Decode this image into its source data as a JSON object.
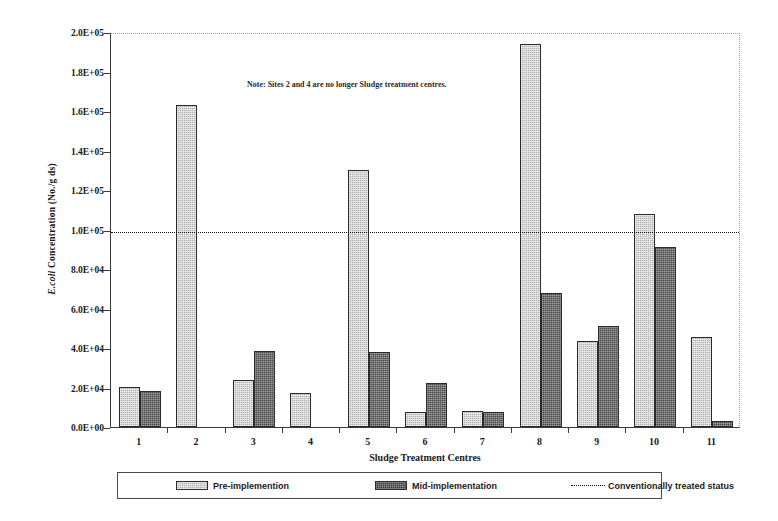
{
  "chart_data": {
    "type": "bar",
    "title": "",
    "xlabel": "Sludge Treatment Centres",
    "ylabel": "E.coli Concentration (No./g ds)",
    "ylabel_italic_part": "E.coli",
    "ylabel_rest": " Concentration (No./g ds)",
    "categories": [
      "1",
      "2",
      "3",
      "4",
      "5",
      "6",
      "7",
      "8",
      "9",
      "10",
      "11"
    ],
    "series": [
      {
        "name": "Pre-implemention",
        "color": "#b3b3b3",
        "values": [
          20500,
          163000,
          24000,
          17000,
          130000,
          7500,
          8000,
          194000,
          43500,
          108000,
          45500
        ]
      },
      {
        "name": "Mid-implementation",
        "color": "#4a4a4a",
        "values": [
          18000,
          0,
          38500,
          0,
          38000,
          22500,
          7500,
          68000,
          51000,
          91000,
          3000
        ]
      }
    ],
    "threshold": {
      "label": "Conventionally treated status",
      "value": 100000,
      "style": "dotted",
      "color": "#111111"
    },
    "ylim": [
      0,
      200000
    ],
    "ytick_values": [
      0,
      20000,
      40000,
      60000,
      80000,
      100000,
      120000,
      140000,
      160000,
      180000,
      200000
    ],
    "ytick_labels": [
      "0.0E+00",
      "2.0E+04",
      "4.0E+04",
      "6.0E+04",
      "8.0E+04",
      "1.0E+05",
      "1.2E+05",
      "1.4E+05",
      "1.6E+05",
      "1.8E+05",
      "2.0E+05"
    ],
    "grid": false,
    "legend_position": "bottom",
    "annotations": [
      {
        "id": "note",
        "text": "Note: Sites 2 and 4 are no longer Sludge treatment centres."
      }
    ]
  }
}
